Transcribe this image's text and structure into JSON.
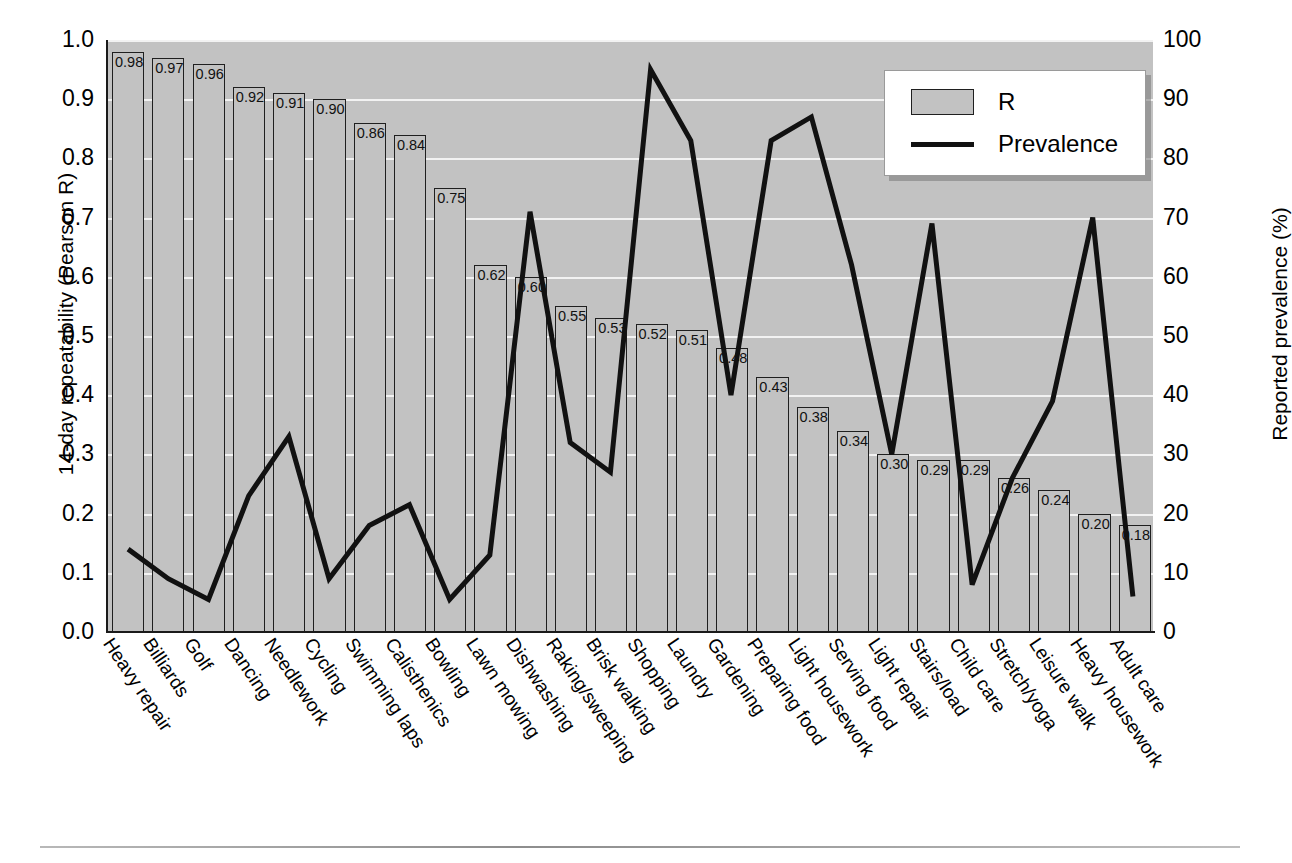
{
  "chart_data": {
    "type": "bar",
    "title": "",
    "xlabel": "",
    "ylabel": "14-day repeatability (Pearson R)",
    "ylabel_right": "Reported prevalence (%)",
    "ylim": [
      0,
      1.0
    ],
    "ylim_right": [
      0,
      100
    ],
    "yticks": [
      "0.0",
      "0.1",
      "0.2",
      "0.3",
      "0.4",
      "0.5",
      "0.6",
      "0.7",
      "0.8",
      "0.9",
      "1.0"
    ],
    "yticks_right": [
      "0",
      "10",
      "20",
      "30",
      "40",
      "50",
      "60",
      "70",
      "80",
      "90",
      "100"
    ],
    "grid": true,
    "legend_position": "upper-right",
    "categories": [
      "Heavy repair",
      "Billiards",
      "Golf",
      "Dancing",
      "Needlework",
      "Cycling",
      "Swimming laps",
      "Calisthenics",
      "Bowling",
      "Lawn mowing",
      "Dishwashing",
      "Raking/sweeping",
      "Brisk walking",
      "Shopping",
      "Laundry",
      "Gardening",
      "Preparing food",
      "Light housework",
      "Serving food",
      "Light repair",
      "Stairs/load",
      "Child care",
      "Stretch/yoga",
      "Leisure walk",
      "Heavy housework",
      "Adult care"
    ],
    "series": [
      {
        "name": "R",
        "type": "bar",
        "axis": "left",
        "color": "#c2c2c2",
        "values": [
          0.98,
          0.97,
          0.96,
          0.92,
          0.91,
          0.9,
          0.86,
          0.84,
          0.75,
          0.62,
          0.6,
          0.55,
          0.53,
          0.52,
          0.51,
          0.48,
          0.43,
          0.38,
          0.34,
          0.3,
          0.29,
          0.29,
          0.26,
          0.24,
          0.2,
          0.18
        ],
        "labels": [
          "0.98",
          "0.97",
          "0.96",
          "0.92",
          "0.91",
          "0.90",
          "0.86",
          "0.84",
          "0.75",
          "0.62",
          "0.60",
          "0.55",
          "0.53",
          "0.52",
          "0.51",
          "0.48",
          "0.43",
          "0.38",
          "0.34",
          "0.30",
          "0.29",
          "0.29",
          "0.26",
          "0.24",
          "0.20",
          "0.18"
        ]
      },
      {
        "name": "Prevalence",
        "type": "line",
        "axis": "right",
        "color": "#111111",
        "values": [
          14,
          9,
          5.5,
          23,
          33,
          9,
          18,
          21.5,
          5.5,
          13,
          71,
          32,
          27,
          95,
          83,
          40,
          83,
          87,
          62,
          30,
          69,
          8,
          26,
          39,
          70,
          6
        ]
      }
    ]
  },
  "legend": {
    "items": [
      {
        "label": "R",
        "marker": "bar-swatch"
      },
      {
        "label": "Prevalence",
        "marker": "line-swatch"
      }
    ]
  }
}
